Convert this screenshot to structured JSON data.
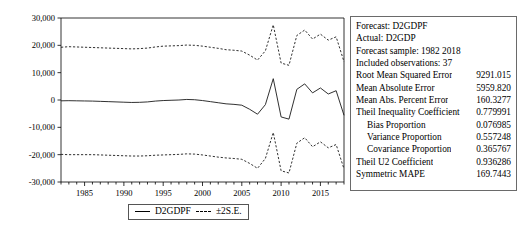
{
  "chart_data": {
    "type": "line",
    "title": "",
    "xlabel": "",
    "ylabel": "",
    "xlim": [
      1982,
      2018
    ],
    "ylim": [
      -30000,
      30000
    ],
    "grid": false,
    "legend_position": "bottom-center",
    "ytick_labels": [
      "30,000",
      "20,000",
      "10,000",
      "0",
      "-10,000",
      "-20,000",
      "-30,000"
    ],
    "ytick_values": [
      30000,
      20000,
      10000,
      0,
      -10000,
      -20000,
      -30000
    ],
    "xtick_labels": [
      "1985",
      "1990",
      "1995",
      "2000",
      "2005",
      "2010",
      "2015"
    ],
    "xtick_values": [
      1985,
      1990,
      1995,
      2000,
      2005,
      2010,
      2015
    ],
    "x": [
      1982,
      1983,
      1984,
      1985,
      1986,
      1987,
      1988,
      1989,
      1990,
      1991,
      1992,
      1993,
      1994,
      1995,
      1996,
      1997,
      1998,
      1999,
      2000,
      2001,
      2002,
      2003,
      2004,
      2005,
      2006,
      2007,
      2008,
      2009,
      2010,
      2011,
      2012,
      2013,
      2014,
      2015,
      2016,
      2017,
      2018
    ],
    "series": [
      {
        "name": "D2GDPF",
        "style": "solid",
        "values": [
          -300,
          -250,
          -300,
          -350,
          -400,
          -500,
          -600,
          -700,
          -800,
          -900,
          -850,
          -700,
          -400,
          -200,
          -100,
          0,
          200,
          100,
          -200,
          -600,
          -1000,
          -1400,
          -1600,
          -1900,
          -3400,
          -5200,
          -1700,
          7800,
          -6200,
          -7000,
          3900,
          5900,
          2600,
          4400,
          2200,
          3400,
          -5600
        ]
      },
      {
        "name": "+2 S.E.",
        "style": "dashed",
        "values": [
          19300,
          19500,
          19400,
          19300,
          19200,
          19100,
          19000,
          18900,
          18800,
          18700,
          18800,
          19000,
          19400,
          19700,
          19800,
          19900,
          20100,
          20000,
          19700,
          19300,
          18900,
          18400,
          18200,
          17900,
          16400,
          14600,
          18000,
          27500,
          13500,
          12700,
          23600,
          25600,
          22300,
          24100,
          21900,
          23100,
          14000
        ]
      },
      {
        "name": "-2 S.E.",
        "style": "dashed",
        "values": [
          -19900,
          -20000,
          -20000,
          -20000,
          -20000,
          -20100,
          -20200,
          -20300,
          -20400,
          -20500,
          -20500,
          -20400,
          -20200,
          -20100,
          -20000,
          -19900,
          -19700,
          -19800,
          -20100,
          -20500,
          -20900,
          -21200,
          -21400,
          -21700,
          -23200,
          -25000,
          -21400,
          -11900,
          -25900,
          -26700,
          -15800,
          -13800,
          -17100,
          -15300,
          -17500,
          -16300,
          -25200
        ]
      }
    ],
    "legend": [
      {
        "label": "D2GDPF",
        "style": "solid"
      },
      {
        "label": "±2S.E.",
        "style": "dashed"
      }
    ]
  },
  "stats_panel": {
    "header_rows": [
      {
        "label": "Forecast: D2GDPF"
      },
      {
        "label": "Actual: D2GDP"
      },
      {
        "label": "Forecast sample: 1982 2018"
      },
      {
        "label": "Included observations: 37"
      }
    ],
    "metric_rows": [
      {
        "label": "Root Mean Squared Error",
        "value": "9291.015",
        "indent": false
      },
      {
        "label": "Mean Absolute Error",
        "value": "5959.820",
        "indent": false
      },
      {
        "label": "Mean Abs. Percent Error",
        "value": "160.3277",
        "indent": false
      },
      {
        "label": "Theil Inequality Coefficient",
        "value": "0.779991",
        "indent": false
      },
      {
        "label": "Bias Proportion",
        "value": "0.076985",
        "indent": true
      },
      {
        "label": "Variance Proportion",
        "value": "0.557248",
        "indent": true
      },
      {
        "label": "Covariance Proportion",
        "value": "0.365767",
        "indent": true
      },
      {
        "label": "Theil U2 Coefficient",
        "value": "0.936286",
        "indent": false
      },
      {
        "label": "Symmetric MAPE",
        "value": "169.7443",
        "indent": false
      }
    ]
  },
  "colors": {
    "line": "#1a1a1a",
    "border": "#6a6a6a",
    "background": "#ffffff"
  }
}
